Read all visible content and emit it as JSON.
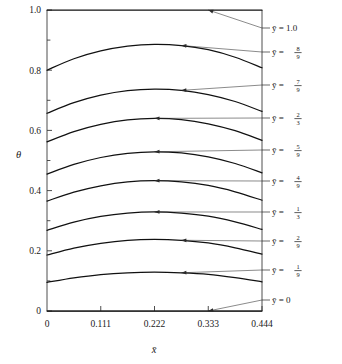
{
  "figure": {
    "background": "#ffffff",
    "curve_color": "#111111",
    "axis_color": "#3a3a3a"
  },
  "chart_data": {
    "type": "line",
    "title": "",
    "xlabel": "x̄",
    "ylabel": "θ",
    "xlim": [
      0,
      0.444
    ],
    "ylim": [
      0,
      1.0
    ],
    "grid": false,
    "legend_position": "right-outside",
    "xticks": [
      0,
      0.111,
      0.222,
      0.333,
      0.444
    ],
    "xticklabels": [
      "0",
      "0.111",
      "0.222",
      "0.333",
      "0.444"
    ],
    "yticks": [
      0,
      0.2,
      0.4,
      0.6,
      0.8,
      1.0
    ],
    "yticklabels": [
      "0",
      "0.2",
      "0.4",
      "0.6",
      "0.8",
      "1.0"
    ],
    "y_minor_ticks": [
      0.1,
      0.3,
      0.5,
      0.7,
      0.9
    ],
    "x": [
      0,
      0.0555,
      0.111,
      0.1665,
      0.222,
      0.2775,
      0.333,
      0.3885,
      0.444
    ],
    "series": [
      {
        "name": "ybar = 1.0",
        "label": "ȳ = 1.0",
        "label_kind": "decimal",
        "label_value": "1.0",
        "values": [
          1.0,
          1.0,
          1.0,
          1.0,
          1.0,
          1.0,
          1.0,
          1.0,
          1.0
        ]
      },
      {
        "name": "ybar = 8/9",
        "label": "ȳ =",
        "label_kind": "fraction",
        "numerator": "8",
        "denominator": "9",
        "values": [
          0.8,
          0.838,
          0.864,
          0.88,
          0.886,
          0.882,
          0.868,
          0.843,
          0.808
        ]
      },
      {
        "name": "ybar = 7/9",
        "label": "ȳ =",
        "label_kind": "fraction",
        "numerator": "7",
        "denominator": "9",
        "values": [
          0.657,
          0.692,
          0.717,
          0.732,
          0.737,
          0.733,
          0.719,
          0.696,
          0.663
        ]
      },
      {
        "name": "ybar = 2/3",
        "label": "ȳ =",
        "label_kind": "fraction",
        "numerator": "2",
        "denominator": "3",
        "values": [
          0.562,
          0.596,
          0.62,
          0.635,
          0.64,
          0.636,
          0.622,
          0.599,
          0.567
        ]
      },
      {
        "name": "ybar = 5/9",
        "label": "ȳ =",
        "label_kind": "fraction",
        "numerator": "5",
        "denominator": "9",
        "values": [
          0.455,
          0.487,
          0.51,
          0.524,
          0.529,
          0.525,
          0.512,
          0.49,
          0.459
        ]
      },
      {
        "name": "ybar = 4/9",
        "label": "ȳ =",
        "label_kind": "fraction",
        "numerator": "4",
        "denominator": "9",
        "values": [
          0.365,
          0.395,
          0.416,
          0.429,
          0.433,
          0.429,
          0.417,
          0.396,
          0.368
        ]
      },
      {
        "name": "ybar = 1/3",
        "label": "ȳ =",
        "label_kind": "fraction",
        "numerator": "1",
        "denominator": "3",
        "values": [
          0.268,
          0.295,
          0.314,
          0.325,
          0.329,
          0.325,
          0.315,
          0.296,
          0.271
        ]
      },
      {
        "name": "ybar = 2/9",
        "label": "ȳ =",
        "label_kind": "fraction",
        "numerator": "2",
        "denominator": "9",
        "values": [
          0.186,
          0.209,
          0.225,
          0.235,
          0.238,
          0.235,
          0.226,
          0.21,
          0.189
        ]
      },
      {
        "name": "ybar = 1/9",
        "label": "ȳ =",
        "label_kind": "fraction",
        "numerator": "1",
        "denominator": "9",
        "values": [
          0.095,
          0.11,
          0.121,
          0.127,
          0.129,
          0.127,
          0.122,
          0.111,
          0.097
        ]
      },
      {
        "name": "ybar = 0",
        "label": "ȳ = 0",
        "label_kind": "decimal",
        "label_value": "0",
        "values": [
          0.0,
          0.0,
          0.0,
          0.0,
          0.0,
          0.0,
          0.0,
          0.0,
          0.0
        ]
      }
    ],
    "annotations": [
      {
        "text": "ȳ = 1.0",
        "points_to_series": "ybar = 1.0"
      },
      {
        "text": "ȳ = 8/9",
        "points_to_series": "ybar = 8/9"
      },
      {
        "text": "ȳ = 7/9",
        "points_to_series": "ybar = 7/9"
      },
      {
        "text": "ȳ = 2/3",
        "points_to_series": "ybar = 2/3"
      },
      {
        "text": "ȳ = 5/9",
        "points_to_series": "ybar = 5/9"
      },
      {
        "text": "ȳ = 4/9",
        "points_to_series": "ybar = 4/9"
      },
      {
        "text": "ȳ = 1/3",
        "points_to_series": "ybar = 1/3"
      },
      {
        "text": "ȳ = 2/9",
        "points_to_series": "ybar = 2/9"
      },
      {
        "text": "ȳ = 1/9",
        "points_to_series": "ybar = 1/9"
      },
      {
        "text": "ȳ = 0",
        "points_to_series": "ybar = 0"
      }
    ]
  },
  "labels": {
    "y_axis": "θ",
    "x_axis": "x̄",
    "ybar_symbol": "ȳ",
    "equals": "="
  }
}
